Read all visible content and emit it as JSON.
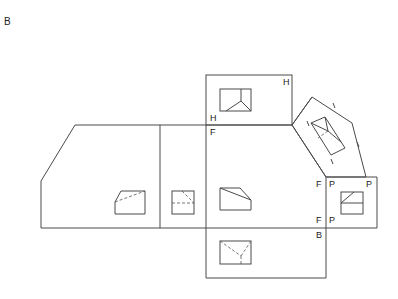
{
  "figure": {
    "label": "B"
  },
  "views": {
    "top": {
      "labels": [
        "H",
        "H"
      ]
    },
    "front": {
      "label": "F"
    },
    "right_side": {
      "labels": [
        "P",
        "P",
        "P"
      ],
      "fold_labels": [
        "F",
        "F"
      ]
    },
    "bottom": {
      "label": "B"
    },
    "auxiliary": {
      "tick_marks": 4
    }
  },
  "fold_labels": {
    "h_top_right": "H",
    "h_fold_left": "H",
    "f_fold_left": "F",
    "fp_top_f": "F",
    "fp_top_p": "P",
    "p_top_right": "P",
    "fp_bottom_f": "F",
    "fp_bottom_p": "P",
    "b_label": "B"
  }
}
